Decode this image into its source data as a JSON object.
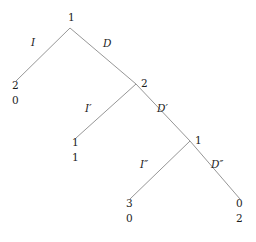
{
  "diagram": {
    "type": "binary-decision-tree",
    "background_color": "#ffffff",
    "edge_color": "#8a8a8a",
    "text_color": "#1d1d1d",
    "nodes": [
      {
        "id": "root",
        "label": "1",
        "x": 70,
        "y": 28
      },
      {
        "id": "n2",
        "label": "2",
        "x": 136,
        "y": 84
      },
      {
        "id": "n3",
        "label": "1",
        "x": 190,
        "y": 141
      }
    ],
    "node_labels": [
      {
        "id": "root-label",
        "text": "1",
        "x": 68,
        "y": 12
      },
      {
        "id": "n2-label",
        "text": "2",
        "x": 141,
        "y": 78
      },
      {
        "id": "n3-label",
        "text": "1",
        "x": 195,
        "y": 135
      }
    ],
    "edge_labels": [
      {
        "id": "edge-I",
        "text": "I",
        "x": 31,
        "y": 37
      },
      {
        "id": "edge-D",
        "text": "D",
        "x": 103,
        "y": 38
      },
      {
        "id": "edge-Iprime",
        "text": "I′",
        "x": 85,
        "y": 103
      },
      {
        "id": "edge-Dprime",
        "text": "D′",
        "x": 157,
        "y": 103
      },
      {
        "id": "edge-Idbl",
        "text": "I″",
        "x": 140,
        "y": 159
      },
      {
        "id": "edge-Ddbl",
        "text": "D″",
        "x": 211,
        "y": 159
      }
    ],
    "leaves": [
      {
        "id": "leaf-1",
        "value": "2",
        "payoff": "0",
        "x": 12,
        "y": 80
      },
      {
        "id": "leaf-2",
        "value": "1",
        "payoff": "1",
        "x": 72,
        "y": 137
      },
      {
        "id": "leaf-3",
        "value": "3",
        "payoff": "0",
        "x": 126,
        "y": 198
      },
      {
        "id": "leaf-4",
        "value": "0",
        "payoff": "2",
        "x": 236,
        "y": 198
      }
    ],
    "edges": [
      {
        "id": "edge-root-left",
        "x1": 70,
        "y1": 28,
        "x2": 16,
        "y2": 81,
        "label": "I"
      },
      {
        "id": "edge-root-right",
        "x1": 70,
        "y1": 28,
        "x2": 136,
        "y2": 84,
        "label": "D"
      },
      {
        "id": "edge-n2-left",
        "x1": 136,
        "y1": 84,
        "x2": 76,
        "y2": 138,
        "label": "I′"
      },
      {
        "id": "edge-n2-right",
        "x1": 136,
        "y1": 84,
        "x2": 190,
        "y2": 141,
        "label": "D′"
      },
      {
        "id": "edge-n3-left",
        "x1": 190,
        "y1": 141,
        "x2": 130,
        "y2": 199,
        "label": "I″"
      },
      {
        "id": "edge-n3-right",
        "x1": 190,
        "y1": 141,
        "x2": 240,
        "y2": 199,
        "label": "D″"
      }
    ]
  }
}
